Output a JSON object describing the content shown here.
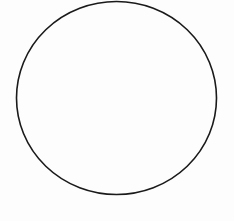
{
  "diagram": {
    "shape": "circle",
    "stroke_color": "#1a1a1a",
    "fill_color": "none",
    "background_color": "#fdfdfd"
  }
}
